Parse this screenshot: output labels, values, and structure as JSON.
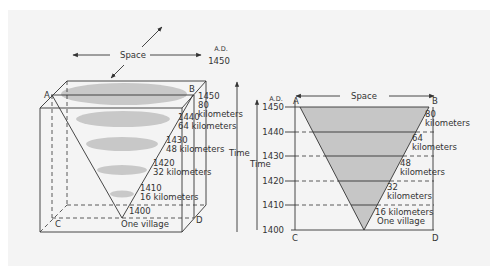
{
  "colors": {
    "background": "#ffffff",
    "panel": "#f4f4f4",
    "ink": "#333333",
    "shading": "#c6c6c6"
  },
  "left_diagram": {
    "space_label": "Space",
    "time_label": "Time",
    "era_label": "A.D.",
    "top_year": "1450",
    "corners": {
      "a": "A",
      "b": "B",
      "c": "C",
      "d": "D"
    },
    "levels": [
      {
        "year": "1450",
        "distance_num": "80",
        "distance_unit": "kilometers"
      },
      {
        "year": "1440",
        "distance": "64 kilometers"
      },
      {
        "year": "1430",
        "distance": "48 kilometers"
      },
      {
        "year": "1420",
        "distance": "32 kilometers"
      },
      {
        "year": "1410",
        "distance": "16 kilometers"
      },
      {
        "year": "1400",
        "distance": "One village"
      }
    ]
  },
  "right_diagram": {
    "space_label": "Space",
    "time_label": "Time",
    "era_label": "A.D.",
    "corners": {
      "a": "A",
      "b": "B",
      "c": "C",
      "d": "D"
    },
    "years": [
      "1450",
      "1440",
      "1430",
      "1420",
      "1410",
      "1400"
    ],
    "distances": [
      {
        "num": "80",
        "unit": "kilometers"
      },
      {
        "num": "64",
        "unit": "kilometers"
      },
      {
        "num": "48",
        "unit": "kilometers"
      },
      {
        "num": "32",
        "unit": "kilometers"
      },
      {
        "line1": "16 kilometers",
        "line2": "One village"
      }
    ]
  }
}
